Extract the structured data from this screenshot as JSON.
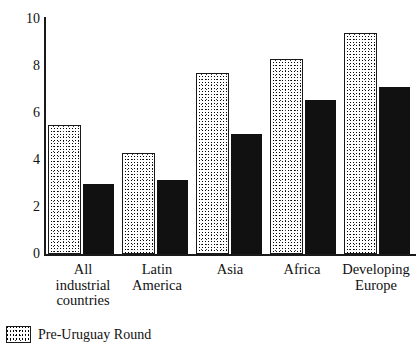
{
  "chart_data": {
    "type": "bar",
    "title": "",
    "xlabel": "",
    "ylabel": "",
    "ylim": [
      0,
      10
    ],
    "grid": false,
    "legend_position": "bottom-left",
    "categories": [
      "All\nindustrial\ncountries",
      "Latin\nAmerica",
      "Asia",
      "Africa",
      "Developing\nEurope"
    ],
    "ytick_labels": [
      "10",
      "8",
      "6",
      "4",
      "2",
      "0"
    ],
    "ytick_values": [
      10,
      8,
      6,
      4,
      2,
      0
    ],
    "series": [
      {
        "name": "Pre-Uruguay Round",
        "style": "stippled",
        "color": "#ffffff",
        "values": [
          5.5,
          4.3,
          7.7,
          8.3,
          9.4
        ]
      },
      {
        "name": "",
        "style": "solid-black",
        "color": "#111111",
        "values": [
          3.0,
          3.15,
          5.1,
          6.55,
          7.1
        ]
      }
    ],
    "legend": [
      {
        "label": "Pre-Uruguay Round",
        "swatch": "stippled"
      }
    ]
  }
}
